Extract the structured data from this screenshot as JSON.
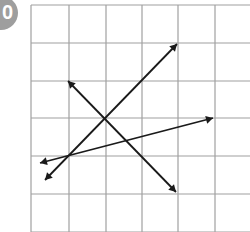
{
  "badge": {
    "label": "0",
    "color": "#9e9e9e"
  },
  "grid": {
    "cols": 6,
    "rows": 6,
    "x": [
      31,
      69,
      106,
      142,
      178,
      215,
      252
    ],
    "y": [
      5,
      43,
      81,
      118,
      156,
      194,
      232
    ],
    "line_color": "#a0a0a0"
  },
  "arrows": [
    {
      "name": "arrow-1",
      "x1": 45,
      "y1": 180,
      "x2": 177,
      "y2": 44
    },
    {
      "name": "arrow-2",
      "x1": 68,
      "y1": 81,
      "x2": 176,
      "y2": 192
    },
    {
      "name": "arrow-3",
      "x1": 40,
      "y1": 163,
      "x2": 213,
      "y2": 118
    }
  ],
  "arrow_color": "#1a1a1a"
}
